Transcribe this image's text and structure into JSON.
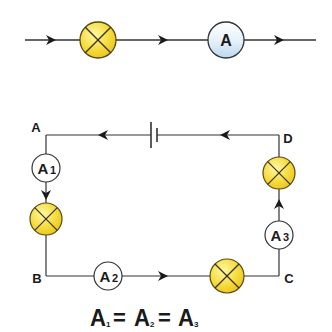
{
  "colors": {
    "wire": "#333333",
    "bulb_fill": "#f5dc3c",
    "bulb_highlight": "#fff7a8",
    "bulb_stroke": "#5a4a10",
    "ammeter_fill": "#ffffff",
    "ammeter_top_fill": "#d6e8f7",
    "text": "#1a1a1a"
  },
  "top_circuit": {
    "ammeter_label": "A"
  },
  "loop": {
    "corners": {
      "A": "A",
      "B": "B",
      "C": "C",
      "D": "D"
    },
    "ammeters": [
      {
        "id": "A1",
        "letter": "A",
        "subscript": "1"
      },
      {
        "id": "A2",
        "letter": "A",
        "subscript": "2"
      },
      {
        "id": "A3",
        "letter": "A",
        "subscript": "3"
      }
    ]
  },
  "equation": {
    "terms": [
      {
        "letter": "A",
        "subscript": "1"
      },
      {
        "letter": "A",
        "subscript": "2"
      },
      {
        "letter": "A",
        "subscript": "3"
      }
    ],
    "operator": "="
  }
}
